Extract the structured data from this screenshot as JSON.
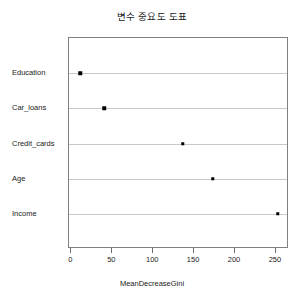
{
  "chart_data": {
    "type": "scatter",
    "title": "변수 중요도 도표",
    "xlabel": "MeanDecreaseGini",
    "ylabel": "",
    "categories": [
      "Income",
      "Age",
      "Credit_cards",
      "Car_loans",
      "Education"
    ],
    "values": [
      252,
      173,
      136,
      40,
      11
    ],
    "xlim": [
      -3,
      266
    ],
    "xticks": [
      0,
      50,
      100,
      150,
      200,
      250
    ],
    "xtick_labels": [
      "0",
      "50",
      "100",
      "150",
      "200",
      "250"
    ],
    "grid": "horizontal-dotted-per-category",
    "legend": "none",
    "point_style": "filled-square",
    "point_color": "#000000",
    "panel_border_color": "#808080",
    "grid_color": "#c8c8c8",
    "background": "#ffffff"
  }
}
